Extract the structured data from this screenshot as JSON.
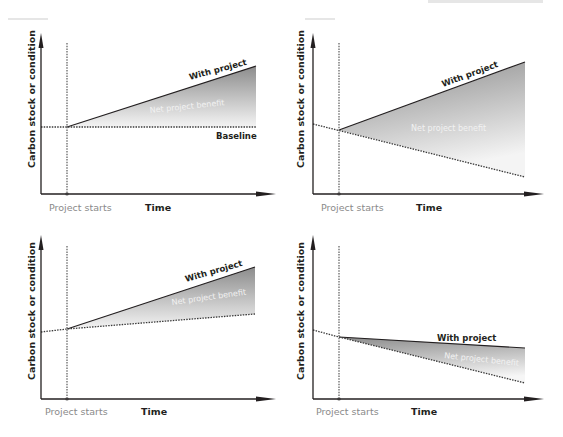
{
  "figure": {
    "title": "",
    "colors": {
      "axis": "#231f20",
      "dotted_line": "#3a3a3a",
      "fill_dark": "#8c8c8c",
      "fill_light": "#f4f4f4",
      "start_label": "#8a8a8a",
      "benefit_text": "#f2f2f2"
    },
    "panels": [
      {
        "id": "top-left",
        "y_axis_label": "Carbon stock or condition",
        "x_axis_label": "Time",
        "start_label": "Project starts",
        "with_project_label": "With project",
        "benefit_label": "Net project benefit",
        "baseline_label": "Baseline",
        "scenario": "flat baseline, rising project"
      },
      {
        "id": "top-right",
        "y_axis_label": "Carbon stock or condition",
        "x_axis_label": "Time",
        "start_label": "Project starts",
        "with_project_label": "With project",
        "benefit_label": "Net project benefit",
        "scenario": "declining baseline, rising project"
      },
      {
        "id": "bottom-left",
        "y_axis_label": "Carbon stock or condition",
        "x_axis_label": "Time",
        "start_label": "Project starts",
        "with_project_label": "With project",
        "benefit_label": "Net project benefit",
        "scenario": "rising baseline, faster rising project"
      },
      {
        "id": "bottom-right",
        "y_axis_label": "Carbon stock or condition",
        "x_axis_label": "Time",
        "start_label": "Project starts",
        "with_project_label": "With project",
        "benefit_label": "Net project benefit",
        "scenario": "declining baseline, slower declining project"
      }
    ]
  }
}
